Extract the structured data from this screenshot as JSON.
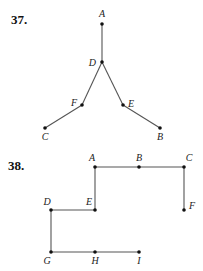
{
  "problems": [
    {
      "number": "37.",
      "graph": {
        "vertices": [
          {
            "id": "A",
            "x": 102,
            "y": 24,
            "lx": 102,
            "ly": 17,
            "anchor": "middle"
          },
          {
            "id": "D",
            "x": 102,
            "y": 62,
            "lx": 96,
            "ly": 66,
            "anchor": "end"
          },
          {
            "id": "F",
            "x": 82,
            "y": 105,
            "lx": 77,
            "ly": 106,
            "anchor": "end"
          },
          {
            "id": "E",
            "x": 123,
            "y": 105,
            "lx": 128,
            "ly": 107,
            "anchor": "start"
          },
          {
            "id": "C",
            "x": 45,
            "y": 128,
            "lx": 45,
            "ly": 140,
            "anchor": "middle"
          },
          {
            "id": "B",
            "x": 160,
            "y": 128,
            "lx": 160,
            "ly": 140,
            "anchor": "middle"
          }
        ],
        "edges": [
          [
            "A",
            "D"
          ],
          [
            "D",
            "F"
          ],
          [
            "D",
            "E"
          ],
          [
            "F",
            "C"
          ],
          [
            "E",
            "B"
          ]
        ]
      }
    },
    {
      "number": "38.",
      "graph": {
        "vertices": [
          {
            "id": "A",
            "x": 95,
            "y": 167,
            "lx": 92,
            "ly": 161,
            "anchor": "middle"
          },
          {
            "id": "B",
            "x": 139,
            "y": 167,
            "lx": 139,
            "ly": 161,
            "anchor": "middle"
          },
          {
            "id": "C",
            "x": 184,
            "y": 167,
            "lx": 189,
            "ly": 161,
            "anchor": "middle"
          },
          {
            "id": "D",
            "x": 51,
            "y": 210,
            "lx": 47,
            "ly": 205,
            "anchor": "middle"
          },
          {
            "id": "E",
            "x": 95,
            "y": 210,
            "lx": 89,
            "ly": 205,
            "anchor": "middle"
          },
          {
            "id": "F",
            "x": 184,
            "y": 210,
            "lx": 189,
            "ly": 209,
            "anchor": "start"
          },
          {
            "id": "G",
            "x": 51,
            "y": 252,
            "lx": 47,
            "ly": 264,
            "anchor": "middle"
          },
          {
            "id": "H",
            "x": 95,
            "y": 252,
            "lx": 95,
            "ly": 264,
            "anchor": "middle"
          },
          {
            "id": "I",
            "x": 139,
            "y": 252,
            "lx": 139,
            "ly": 264,
            "anchor": "middle"
          }
        ],
        "edges": [
          [
            "A",
            "B"
          ],
          [
            "B",
            "C"
          ],
          [
            "C",
            "F"
          ],
          [
            "A",
            "E"
          ],
          [
            "E",
            "D"
          ],
          [
            "D",
            "G"
          ],
          [
            "G",
            "H"
          ],
          [
            "H",
            "I"
          ]
        ]
      }
    }
  ]
}
